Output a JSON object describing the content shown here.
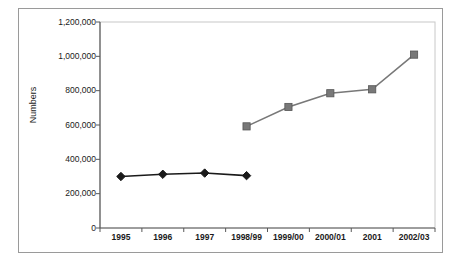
{
  "chart_data": {
    "type": "line",
    "title": "",
    "xlabel": "",
    "ylabel": "Numbers",
    "categories": [
      "1995",
      "1996",
      "1997",
      "1998/99",
      "1999/00",
      "2000/01",
      "2001",
      "2002/03"
    ],
    "ylim": [
      0,
      1200000
    ],
    "ytick_labels": [
      "1,200,000",
      "1,000,000",
      "800,000",
      "600,000",
      "400,000",
      "200,000",
      "0"
    ],
    "ytick_values": [
      1200000,
      1000000,
      800000,
      600000,
      400000,
      200000,
      0
    ],
    "grid": false,
    "legend": "none",
    "series": [
      {
        "name": "series-1",
        "marker": "diamond",
        "color": "#1a1a1a",
        "values": [
          300000,
          313000,
          320000,
          305000,
          null,
          null,
          null,
          null
        ]
      },
      {
        "name": "series-2",
        "marker": "square",
        "color": "#787878",
        "values": [
          null,
          null,
          null,
          592000,
          705000,
          785000,
          808000,
          1010000
        ]
      }
    ]
  },
  "axis": {
    "y_title": "Numbers"
  }
}
